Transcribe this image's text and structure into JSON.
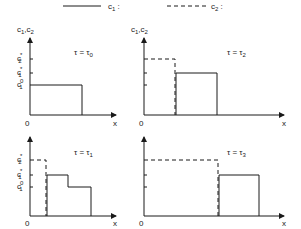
{
  "legend": {
    "items": [
      {
        "style": "solid",
        "label": "c",
        "subscript": "1",
        "suffix": " :"
      },
      {
        "style": "dashed",
        "label": "c",
        "subscript": "2",
        "suffix": " :"
      }
    ]
  },
  "axes": {
    "y_label": "c",
    "y_label_sub1": "1",
    "y_label_sep": ",c",
    "y_label_sub2": "2",
    "x_label": "x",
    "origin_label": "0"
  },
  "levels": {
    "c2_star": {
      "base": "c",
      "sup": "*",
      "sub": "2"
    },
    "c1_star": {
      "base": "c",
      "sup": "*",
      "sub": "1"
    },
    "c1_zero": {
      "base": "c",
      "sup": "0",
      "sub": "1"
    }
  },
  "panels": [
    {
      "id": "tau0",
      "title": "τ = τ",
      "title_sub": "0",
      "position": "top-left"
    },
    {
      "id": "tau2",
      "title": "τ = τ",
      "title_sub": "2",
      "position": "top-right"
    },
    {
      "id": "tau1",
      "title": "τ = τ",
      "title_sub": "1",
      "position": "bottom-left"
    },
    {
      "id": "tau3",
      "title": "τ = τ",
      "title_sub": "3",
      "position": "bottom-right"
    }
  ],
  "colors": {
    "ink": "#1a1a1a",
    "background": "#ffffff"
  }
}
